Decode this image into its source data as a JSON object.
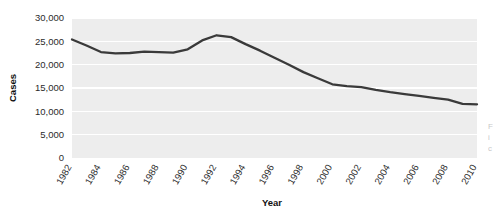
{
  "chart_data": {
    "type": "line",
    "title": "",
    "xlabel": "Year",
    "ylabel": "Cases",
    "grid": "horizontal",
    "legend": "none",
    "xlim": [
      1982,
      2010
    ],
    "ylim": [
      0,
      30000
    ],
    "ytick_labels": [
      "30,000",
      "25,000",
      "20,000",
      "15,000",
      "10,000",
      "5,000",
      "0"
    ],
    "ytick_values": [
      30000,
      25000,
      20000,
      15000,
      10000,
      5000,
      0
    ],
    "xtick_labels": [
      "1982",
      "1984",
      "1986",
      "1988",
      "1990",
      "1992",
      "1994",
      "1996",
      "1998",
      "2000",
      "2002",
      "2004",
      "2006",
      "2008",
      "2010"
    ],
    "xtick_values": [
      1982,
      1984,
      1986,
      1988,
      1990,
      1992,
      1994,
      1996,
      1998,
      2000,
      2002,
      2004,
      2006,
      2008,
      2010
    ],
    "x": [
      1982,
      1983,
      1984,
      1985,
      1986,
      1987,
      1988,
      1989,
      1990,
      1991,
      1992,
      1993,
      1994,
      1995,
      1996,
      1997,
      1998,
      1999,
      2000,
      2001,
      2002,
      2003,
      2004,
      2005,
      2006,
      2007,
      2008,
      2009,
      2010
    ],
    "values": [
      25400,
      24100,
      22700,
      22400,
      22500,
      22800,
      22700,
      22600,
      23300,
      25200,
      26300,
      25900,
      24400,
      23000,
      21500,
      20000,
      18400,
      17100,
      15800,
      15400,
      15200,
      14600,
      14100,
      13700,
      13300,
      12900,
      12500,
      11600,
      11500
    ],
    "series_name": "Cases",
    "line_color": "#3a3a3a",
    "plot_background": "#ededed",
    "gridline_color": "#ffffff"
  },
  "axes": {
    "y_title": "Cases",
    "x_title": "Year"
  },
  "edge_fragment": {
    "line1": "F",
    "line2": "i",
    "line3": "c"
  }
}
